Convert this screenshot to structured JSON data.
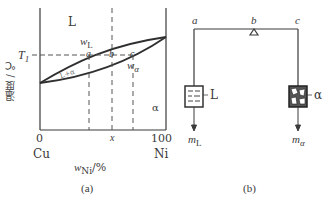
{
  "panel_a": {
    "caption": "(a)",
    "y_axis_label": "温度 / ℃",
    "x_axis_label_main": "w",
    "x_axis_label_sub": "Ni",
    "x_axis_label_unit": "/%",
    "x_ticks": [
      "0",
      "100"
    ],
    "x_composition": "x",
    "left_component": "Cu",
    "right_component": "Ni",
    "temperature_mark": "T",
    "temperature_mark_sub": "1",
    "region_liquid": "L",
    "region_two_phase": "L+α",
    "region_solid": "α",
    "liquidus_label": "w",
    "liquidus_label_sub": "L",
    "solidus_label": "w",
    "solidus_label_sub": "α",
    "points": [
      "a",
      "b",
      "c"
    ]
  },
  "panel_b": {
    "caption": "(b)",
    "lever_points": [
      "a",
      "b",
      "c"
    ],
    "left_phase": "L",
    "right_phase": "α",
    "left_mass": "m",
    "left_mass_sub": "L",
    "right_mass": "m",
    "right_mass_sub": "α"
  },
  "colors": {
    "line": "#3a3a3a",
    "dashed": "#555555",
    "background": "#ffffff"
  }
}
